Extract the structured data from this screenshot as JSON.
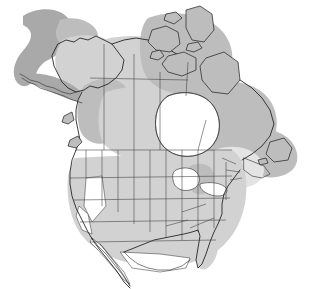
{
  "figure": {
    "kind": "map",
    "projection_note": "North America, conic",
    "background_color": "#ffffff",
    "outline_color": "#1c1c1c"
  },
  "legend": {
    "visible": false,
    "classes": [
      {
        "name": "dark-shading",
        "color": "#a9a9a9",
        "label": ""
      },
      {
        "name": "mid-shading",
        "color": "#bdbdbd",
        "label": ""
      },
      {
        "name": "light-shading",
        "color": "#d2d2d2",
        "label": ""
      },
      {
        "name": "pale-shading",
        "color": "#e4e4e4",
        "label": ""
      },
      {
        "name": "unshaded",
        "color": "#ffffff",
        "label": ""
      }
    ]
  },
  "regions": [
    {
      "name": "bering-offshore-blob",
      "shading": "dark-shading"
    },
    {
      "name": "alaska-mainland",
      "shading": "light-shading"
    },
    {
      "name": "aleutian-chain",
      "shading": "dark-shading"
    },
    {
      "name": "yukon-northwest-terr",
      "shading": "light-shading"
    },
    {
      "name": "british-columbia",
      "shading": "mid-shading"
    },
    {
      "name": "prairie-provinces",
      "shading": "light-shading"
    },
    {
      "name": "arctic-archipelago",
      "shading": "mid-shading"
    },
    {
      "name": "hudson-bay",
      "shading": "unshaded"
    },
    {
      "name": "quebec-labrador",
      "shading": "mid-shading"
    },
    {
      "name": "newfoundland",
      "shading": "mid-shading"
    },
    {
      "name": "maritimes",
      "shading": "mid-shading"
    },
    {
      "name": "great-lakes",
      "shading": "unshaded"
    },
    {
      "name": "michigan",
      "shading": "mid-shading"
    },
    {
      "name": "western-united-states",
      "shading": "light-shading"
    },
    {
      "name": "nevada",
      "shading": "unshaded"
    },
    {
      "name": "great-plains",
      "shading": "light-shading"
    },
    {
      "name": "southeast-united-states",
      "shading": "light-shading"
    },
    {
      "name": "florida",
      "shading": "light-shading"
    },
    {
      "name": "new-england",
      "shading": "pale-shading"
    },
    {
      "name": "baja-california",
      "shading": "unshaded"
    },
    {
      "name": "northern-mexico",
      "shading": "unshaded"
    }
  ],
  "labels": {
    "visible_text": []
  }
}
